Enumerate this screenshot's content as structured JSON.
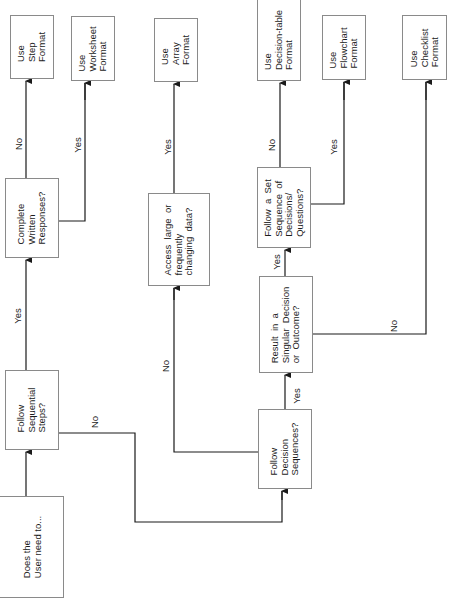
{
  "diagram": {
    "orientation": "rotated 90deg counter-clockwise",
    "nodes": {
      "start": {
        "text": "Does the\nUser need to..."
      },
      "q_sequential": {
        "text": "Follow\nSequential\nSteps?"
      },
      "q_written": {
        "text": "Complete\nWritten\nResponses?"
      },
      "out_step": {
        "text": "Use\nStep\nFormat"
      },
      "out_worksheet": {
        "text": "Use\nWorksheet\nFormat"
      },
      "q_access": {
        "text": "Access  large  or\nfrequently\nchanging  data?"
      },
      "out_array": {
        "text": "Use\nArray\nFormat"
      },
      "q_decision_seq": {
        "text": "Follow\nDecision\nSequences?"
      },
      "q_singular": {
        "text": "Result  in  a\nSingular  Decision\nor  Outcome?"
      },
      "q_set_sequence": {
        "text": "Follow  a  Set\nSequence  of\nDecisions/\nQuestions?"
      },
      "out_decision_table": {
        "text": "Use\nDecision-table\nFormat"
      },
      "out_flowchart": {
        "text": "Use\nFlowchart\nFormat"
      },
      "out_checklist": {
        "text": "Use\nChecklist\nFormat"
      }
    },
    "edge_labels": {
      "sequential_yes": "Yes",
      "sequential_no": "No",
      "written_no": "No",
      "written_yes": "Yes",
      "decision_seq_no": "No",
      "access_yes": "Yes",
      "decision_seq_yes": "Yes",
      "singular_yes": "Yes",
      "singular_no": "No",
      "set_sequence_no": "No",
      "set_sequence_yes": "Yes"
    },
    "colors": {
      "line": "#1a1a1a",
      "box_border": "#8a8a8a",
      "text": "#1c1c1c",
      "background": "#ffffff"
    }
  }
}
